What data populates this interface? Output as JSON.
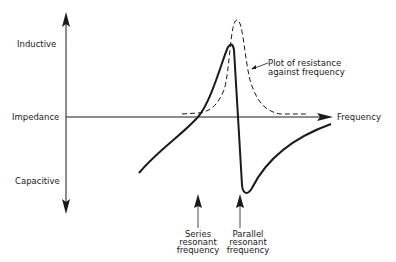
{
  "diagram": {
    "type": "impedance-vs-frequency",
    "axes": {
      "y_top_label": "Inductive",
      "y_middle_label": "Impedance",
      "y_bottom_label": "Capacitive",
      "x_label": "Frequency"
    },
    "annotations": {
      "dashed_curve_label_line1": "Plot of resistance",
      "dashed_curve_label_line2": "against frequency",
      "series_line1": "Series",
      "series_line2": "resonant",
      "series_line3": "frequency",
      "parallel_line1": "Parallel",
      "parallel_line2": "resonant",
      "parallel_line3": "frequency"
    },
    "curves": [
      {
        "name": "reactance",
        "style": "solid"
      },
      {
        "name": "resistance",
        "style": "dashed"
      }
    ],
    "colors": {
      "ink": "#1a1a1a",
      "background": "#ffffff"
    }
  }
}
